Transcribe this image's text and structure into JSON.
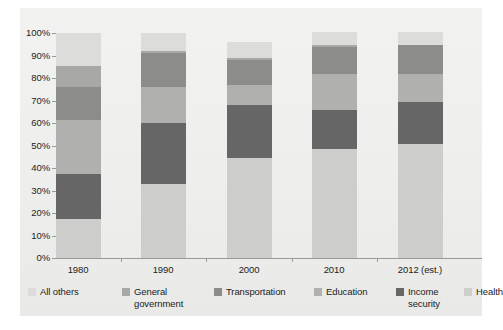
{
  "chart_data": {
    "type": "bar",
    "stacked": true,
    "stack_mode": "percent",
    "title": "",
    "subtitle": "",
    "xlabel": "",
    "ylabel": "",
    "ylim": [
      0,
      100
    ],
    "grid": false,
    "legend_position": "bottom",
    "categories": [
      "1980",
      "1990",
      "2000",
      "2010",
      "2012 (est.)"
    ],
    "y_ticks": [
      0,
      10,
      20,
      30,
      40,
      50,
      60,
      70,
      80,
      90,
      100
    ],
    "y_tick_labels": [
      "0%",
      "10%",
      "20%",
      "30%",
      "40%",
      "50%",
      "60%",
      "70%",
      "80%",
      "90%",
      "100%"
    ],
    "stack_order_bottom_to_top": [
      "Health",
      "Income security",
      "Education",
      "Transportation",
      "General government",
      "All others"
    ],
    "series": [
      {
        "name": "Health",
        "color": "#cdcdcb",
        "values": [
          17.5,
          33.0,
          44.5,
          48.5,
          50.5
        ]
      },
      {
        "name": "Income security",
        "color": "#666666",
        "values": [
          20.0,
          27.0,
          23.5,
          17.5,
          19.0
        ]
      },
      {
        "name": "Education",
        "color": "#b0b0ae",
        "values": [
          24.0,
          16.0,
          9.0,
          16.0,
          12.5
        ]
      },
      {
        "name": "Transportation",
        "color": "#8c8c8a",
        "values": [
          14.5,
          15.0,
          11.0,
          12.0,
          12.5
        ]
      },
      {
        "name": "General government",
        "color": "#a8a8a6",
        "values": [
          9.5,
          1.0,
          1.0,
          0.5,
          0.0
        ]
      },
      {
        "name": "All others",
        "color": "#dcdcda",
        "values": [
          14.5,
          8.0,
          7.0,
          6.0,
          6.0
        ]
      }
    ]
  },
  "axis": {
    "y_labels": [
      "100%",
      "90%",
      "80%",
      "70%",
      "60%",
      "50%",
      "40%",
      "30%",
      "20%",
      "10%",
      "0%"
    ],
    "x_labels": [
      "1980",
      "1990",
      "2000",
      "2010",
      "2012 (est.)"
    ]
  },
  "legend": {
    "items": [
      {
        "label": "All others",
        "color": "#dcdcda"
      },
      {
        "label": "General\ngovernment",
        "color": "#a8a8a6"
      },
      {
        "label": "Transportation",
        "color": "#8c8c8a"
      },
      {
        "label": "Education",
        "color": "#b0b0ae"
      },
      {
        "label": "Income\nsecurity",
        "color": "#666666"
      },
      {
        "label": "Health",
        "color": "#cdcdcb"
      }
    ]
  },
  "colors": {
    "axis": "#9a9a98",
    "text": "#1c1c1c",
    "background": "#ffffff",
    "panel": "#eeeeec"
  }
}
